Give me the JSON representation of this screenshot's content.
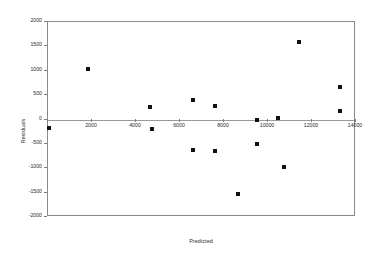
{
  "chart_data": {
    "type": "scatter",
    "title": "",
    "xlabel": "Predicted",
    "ylabel": "Residuals",
    "xlim": [
      0,
      14000
    ],
    "ylim": [
      -2000,
      2000
    ],
    "grid": false,
    "legend": "none",
    "xticks": [
      "0",
      "2000",
      "4000",
      "6000",
      "8000",
      "10000",
      "12000",
      "14000"
    ],
    "xtick_values": [
      0,
      2000,
      4000,
      6000,
      8000,
      10000,
      12000,
      14000
    ],
    "yticks": [
      "2000",
      "1500",
      "1000",
      "500",
      "0",
      "-500",
      "-1000",
      "-1500",
      "-2000"
    ],
    "ytick_values": [
      2000,
      1500,
      1000,
      500,
      0,
      -500,
      -1000,
      -1500,
      -2000
    ],
    "marker": "square",
    "marker_color": "#111111",
    "zero_line": true,
    "series": [
      {
        "name": "Residuals",
        "points": [
          {
            "x": 60,
            "y": -170
          },
          {
            "x": 1820,
            "y": 1030
          },
          {
            "x": 4650,
            "y": 250
          },
          {
            "x": 4720,
            "y": -205
          },
          {
            "x": 6600,
            "y": 390
          },
          {
            "x": 6570,
            "y": -630
          },
          {
            "x": 7570,
            "y": 275
          },
          {
            "x": 7570,
            "y": -640
          },
          {
            "x": 8640,
            "y": -1535
          },
          {
            "x": 9480,
            "y": 0
          },
          {
            "x": 9520,
            "y": -510
          },
          {
            "x": 10470,
            "y": 30
          },
          {
            "x": 10720,
            "y": -965
          },
          {
            "x": 11400,
            "y": 1580
          },
          {
            "x": 13250,
            "y": 660
          },
          {
            "x": 13250,
            "y": 165
          }
        ]
      }
    ]
  },
  "axes": {
    "x_title": "Predicted",
    "y_title": "Residuals"
  },
  "colors": {
    "frame": "#8a8a8a",
    "marker": "#111111",
    "zero_line": "#9a9a9a",
    "text": "#2b2b2b",
    "background": "#ffffff"
  }
}
